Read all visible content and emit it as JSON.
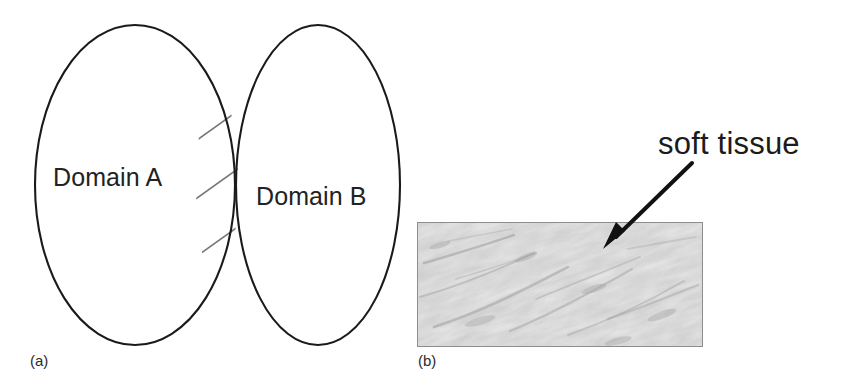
{
  "figure": {
    "background_color": "#ffffff",
    "width": 854,
    "height": 392,
    "stroke_color": "#1a1a1a",
    "hatch_color": "#6e6e6e"
  },
  "panel_a": {
    "caption": "(a)",
    "type": "venn-diagram",
    "left_set": {
      "label": "Domain A",
      "cx": 135,
      "cy": 185,
      "rx": 100,
      "ry": 160
    },
    "right_set": {
      "label": "Domain B",
      "cx": 318,
      "cy": 185,
      "rx": 82,
      "ry": 160
    },
    "intersection": {
      "fill": "diagonal-hatch",
      "hatch_line_count": 4,
      "hatch_direction": "lower-left-to-upper-right",
      "hatch_color": "#707070",
      "top_point_y": 75,
      "bottom_point_y": 295,
      "center_x": 217
    }
  },
  "panel_b": {
    "caption": "(b)",
    "type": "annotated-micrograph",
    "annotation_label": "soft tissue",
    "arrow": {
      "from_x": 282,
      "from_y": 163,
      "to_x": 196,
      "to_y": 247,
      "color": "#111111",
      "head": "solid-triangle"
    },
    "image_frame": {
      "x": 7,
      "y": 222,
      "width": 284,
      "height": 123,
      "border_color": "#8d8d8d",
      "content": "grayscale fibrous soft tissue texture",
      "base_color": "#f2f2f2",
      "streak_color": "#9a9a9a"
    }
  }
}
